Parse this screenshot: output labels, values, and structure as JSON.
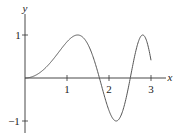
{
  "chart_data": {
    "type": "line",
    "title": "",
    "xlabel": "x",
    "ylabel": "y",
    "function": "y = sin(x^2)",
    "xlim": [
      0,
      3
    ],
    "ylim": [
      -1,
      1
    ],
    "x_ticks": [
      "1",
      "2",
      "3"
    ],
    "y_ticks": [
      "1",
      "-1"
    ],
    "grid": false,
    "legend": null,
    "series": [
      {
        "name": "sin(x^2)",
        "x": [
          0,
          0.25,
          0.5,
          0.75,
          1.0,
          1.25,
          1.5,
          1.77,
          2.0,
          2.17,
          2.3,
          2.51,
          2.65,
          2.8,
          2.9,
          3.0
        ],
        "values": [
          0,
          0.06,
          0.25,
          0.53,
          0.84,
          1.0,
          0.78,
          0.0,
          -0.76,
          -1.0,
          -0.84,
          0.0,
          0.66,
          1.0,
          0.85,
          0.41
        ]
      }
    ],
    "key_points": {
      "max1": [
        1.25,
        1
      ],
      "zero1": [
        1.77,
        0
      ],
      "min1": [
        2.17,
        -1
      ],
      "zero2": [
        2.51,
        0
      ],
      "max2": [
        2.8,
        1
      ],
      "end": [
        3.0,
        0.41
      ]
    }
  },
  "labels": {
    "x_axis": "x",
    "y_axis": "y",
    "xt1": "1",
    "xt2": "2",
    "xt3": "3",
    "yt1": "1",
    "ytm1": "−1"
  },
  "colors": {
    "axis": "#333333",
    "curve": "#555555"
  }
}
